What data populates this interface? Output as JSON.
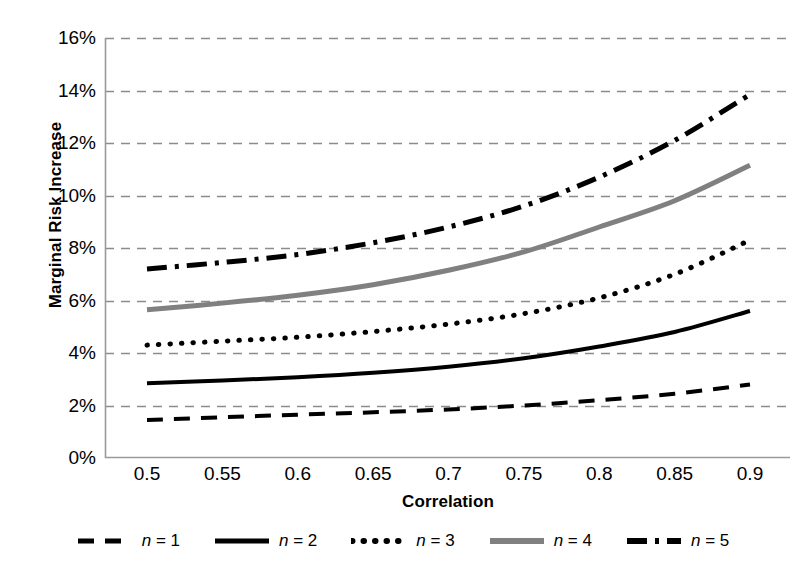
{
  "chart_data": {
    "type": "line",
    "title": "",
    "xlabel": "Correlation",
    "ylabel": "Marginal Risk Increase",
    "x": [
      0.5,
      0.55,
      0.6,
      0.65,
      0.7,
      0.75,
      0.8,
      0.85,
      0.9
    ],
    "xtick_labels": [
      "0.5",
      "0.55",
      "0.6",
      "0.65",
      "0.7",
      "0.75",
      "0.8",
      "0.85",
      "0.9"
    ],
    "ytick_labels": [
      "0%",
      "2%",
      "4%",
      "6%",
      "8%",
      "10%",
      "12%",
      "14%",
      "16%"
    ],
    "ytick_values": [
      0,
      2,
      4,
      6,
      8,
      10,
      12,
      14,
      16
    ],
    "xlim": [
      0.5,
      0.9
    ],
    "ylim": [
      0,
      16
    ],
    "grid": "horizontal-dashed",
    "legend_position": "bottom",
    "series": [
      {
        "name": "n = 1",
        "legend_label": "n = 1",
        "style": "dashed",
        "color": "#000000",
        "width": 4,
        "dash": "16,11",
        "values": [
          1.45,
          1.55,
          1.65,
          1.74,
          1.85,
          2.0,
          2.2,
          2.45,
          2.8
        ]
      },
      {
        "name": "n = 2",
        "legend_label": "n = 2",
        "style": "solid",
        "color": "#000000",
        "width": 4,
        "dash": "none",
        "values": [
          2.85,
          2.95,
          3.08,
          3.25,
          3.48,
          3.8,
          4.25,
          4.8,
          5.6
        ]
      },
      {
        "name": "n = 3",
        "legend_label": "n = 3",
        "style": "dotted",
        "color": "#000000",
        "width": 5,
        "dash": "0.5,11",
        "values": [
          4.3,
          4.45,
          4.6,
          4.82,
          5.1,
          5.5,
          6.1,
          7.0,
          8.3
        ]
      },
      {
        "name": "n = 4",
        "legend_label": "n = 4",
        "style": "solid",
        "color": "#808080",
        "width": 5,
        "dash": "none",
        "values": [
          5.65,
          5.9,
          6.2,
          6.6,
          7.15,
          7.85,
          8.8,
          9.8,
          11.15
        ]
      },
      {
        "name": "n = 5",
        "legend_label": "n = 5",
        "style": "dash-dot",
        "color": "#000000",
        "width": 5,
        "dash": "20,8,4,8",
        "values": [
          7.2,
          7.45,
          7.75,
          8.2,
          8.8,
          9.6,
          10.7,
          12.1,
          13.85
        ]
      }
    ]
  }
}
